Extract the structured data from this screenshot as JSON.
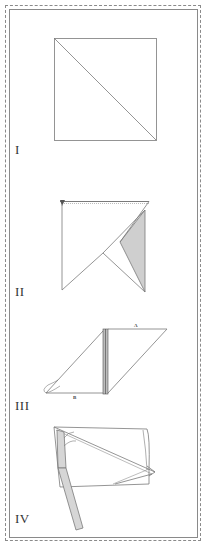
{
  "figure": {
    "type": "folding-instructions",
    "colors": {
      "line": "#7a7a7a",
      "shade": "#cfcfcf",
      "frame": "#8a8a8a",
      "label": "#333333"
    },
    "steps": [
      {
        "id": "step-1",
        "label": "I",
        "description": "Square with diagonal fold line"
      },
      {
        "id": "step-2",
        "label": "II",
        "description": "Square folded with shaded triangular flap"
      },
      {
        "id": "step-3",
        "label": "III",
        "description": "Parallelogram fold with points A and B",
        "points": [
          {
            "label": "A"
          },
          {
            "label": "B"
          }
        ]
      },
      {
        "id": "step-4",
        "label": "IV",
        "description": "Folded tie-like band wrapped over rectangle"
      }
    ]
  }
}
